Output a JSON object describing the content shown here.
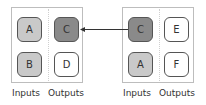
{
  "colors": {
    "dark": "#8a8a8a",
    "light": "#c9c9c9",
    "white": "#ffffff"
  },
  "left_block": {
    "inputs": [
      {
        "label": "A",
        "fill": "light"
      },
      {
        "label": "B",
        "fill": "light"
      }
    ],
    "outputs": [
      {
        "label": "C",
        "fill": "dark"
      },
      {
        "label": "D",
        "fill": "white"
      }
    ],
    "inputs_label": "Inputs",
    "outputs_label": "Outputs"
  },
  "right_block": {
    "inputs": [
      {
        "label": "C",
        "fill": "dark"
      },
      {
        "label": "A",
        "fill": "light"
      }
    ],
    "outputs": [
      {
        "label": "E",
        "fill": "white"
      },
      {
        "label": "F",
        "fill": "white"
      }
    ],
    "inputs_label": "Inputs",
    "outputs_label": "Outputs"
  },
  "arrow": {
    "from": "right_block.inputs.0",
    "to": "left_block.outputs.0"
  }
}
